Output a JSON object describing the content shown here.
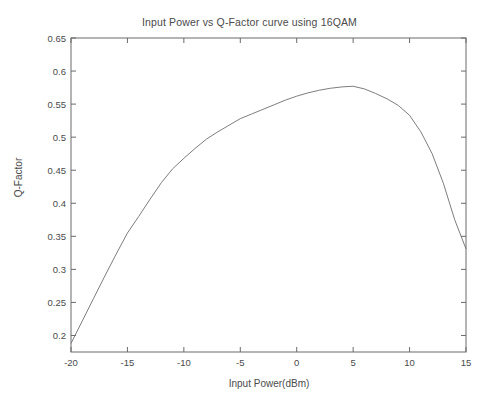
{
  "chart_data": {
    "type": "line",
    "title": "Input Power vs Q-Factor curve using 16QAM",
    "xlabel": "Input Power(dBm)",
    "ylabel": "Q-Factor",
    "xlim": [
      -20,
      15
    ],
    "ylim": [
      0.175,
      0.65
    ],
    "grid": false,
    "legend": null,
    "xticks": [
      -20,
      -15,
      -10,
      -5,
      0,
      5,
      10,
      15
    ],
    "xtick_labels": [
      "-20",
      "-15",
      "-10",
      "-5",
      "0",
      "5",
      "10",
      "15"
    ],
    "yticks": [
      0.2,
      0.25,
      0.3,
      0.35,
      0.4,
      0.45,
      0.5,
      0.55,
      0.6,
      0.65
    ],
    "ytick_labels": [
      "0.2",
      "0.25",
      "0.3",
      "0.35",
      "0.4",
      "0.45",
      "0.5",
      "0.55",
      "0.6",
      "0.65"
    ],
    "line_color": "#6e6e6e",
    "axis_color": "#6a6a6a",
    "background": "#ffffff",
    "series": [
      {
        "name": "Q-Factor",
        "x": [
          -20,
          -19,
          -18,
          -17,
          -16,
          -15,
          -14,
          -13,
          -12,
          -11,
          -10,
          -9,
          -8,
          -7,
          -6,
          -5,
          -4,
          -3,
          -2,
          -1,
          0,
          1,
          2,
          3,
          4,
          5,
          6,
          7,
          8,
          9,
          10,
          11,
          12,
          13,
          14,
          15
        ],
        "values": [
          0.188,
          0.222,
          0.256,
          0.29,
          0.323,
          0.355,
          0.38,
          0.406,
          0.431,
          0.452,
          0.468,
          0.483,
          0.497,
          0.508,
          0.518,
          0.528,
          0.535,
          0.542,
          0.549,
          0.556,
          0.562,
          0.567,
          0.571,
          0.574,
          0.576,
          0.577,
          0.573,
          0.566,
          0.558,
          0.548,
          0.533,
          0.508,
          0.475,
          0.43,
          0.375,
          0.331
        ]
      }
    ]
  }
}
